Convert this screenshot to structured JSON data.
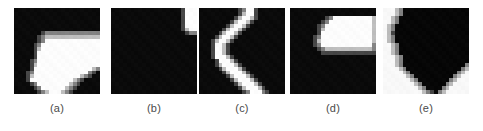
{
  "figure": {
    "type": "image-panel-row",
    "background_color": "#ffffff",
    "panel_count": 5,
    "panel_size_px": 86,
    "caption_color": "#4a4a4a",
    "panels": [
      {
        "id": "a",
        "caption": "(a)",
        "polarity": "dark-background",
        "background_color": "#0a0a0a",
        "foreground_color": "#ffffff",
        "description": "bright blob occupying lower-right, flat top edge with a downward tapering wedge at bottom",
        "grid_size": 22,
        "grid": [
          "0000000000000000000000",
          "0000000000000000000000",
          "0000000000000000000000",
          "0000000000000000000000",
          "0000000000000000000000",
          "0000000000000000000000",
          "0000000122222222222222",
          "0000001233333333333333",
          "0000001244444444444444",
          "0000012444444444444444",
          "0000013444444444444444",
          "0000014444444444444444",
          "0000014444444444444444",
          "0000124444444444444444",
          "0000134444444444444444",
          "0000144444444444444432",
          "0001244444444444444210",
          "0001344444444444432100",
          "0001444444444443210000",
          "0000124444444432100000",
          "0000012444444321000000",
          "0000001234443210000000"
        ]
      },
      {
        "id": "b",
        "caption": "(b)",
        "polarity": "dark-background",
        "background_color": "#0a0a0a",
        "foreground_color": "#ffffff",
        "description": "almost entirely dark, one small bright vertical rectangle at the top-right corner",
        "grid_size": 22,
        "grid": [
          "0000000000000000001444",
          "0000000000000000001444",
          "0000000000000000001444",
          "0000000000000000001444",
          "0000000000000000001444",
          "0000000000000000001344",
          "0000000000000000000122",
          "0000000000000000000000",
          "0000000000000000000000",
          "0000000000000000000000",
          "0000000000000000000000",
          "0000000000000000000000",
          "0000000000000000000000",
          "0000000000000000000000",
          "0000000000000000000000",
          "0000000000000000000000",
          "0000000000000000000000",
          "0000000000000000000000",
          "0000000000000000000000",
          "0000000000000000000000",
          "0000000000000000000000",
          "0000000000000000000000"
        ]
      },
      {
        "id": "c",
        "caption": "(c)",
        "polarity": "dark-background",
        "background_color": "#0a0a0a",
        "foreground_color": "#ffffff",
        "description": "bright curved stripe running top to bottom, bowing left in the middle like a crescent",
        "grid_size": 22,
        "grid": [
          "0000000000124410000000",
          "0000000000134410000000",
          "0000000001344310000000",
          "0000000013443100000000",
          "0000000134431000000000",
          "0000001344310000000000",
          "0000013443100000000000",
          "0000134431000000000000",
          "0001344310000000000000",
          "0001443100000000000000",
          "0001443100000000000000",
          "0001443100000000000000",
          "0001444310000000000000",
          "0000144431000000000000",
          "0000134443100000000000",
          "0000013444310000000000",
          "0000001344431000000000",
          "0000000134443100000000",
          "0000000013444310000000",
          "0000000001344431000000",
          "0000000000134443100000",
          "0000000000012444210000"
        ]
      },
      {
        "id": "d",
        "caption": "(d)",
        "polarity": "dark-background",
        "background_color": "#0a0a0a",
        "foreground_color": "#ffffff",
        "description": "solid bright rectangle in the upper-right quadrant, touching the top edge, dark elsewhere",
        "grid_size": 22,
        "grid": [
          "0000000000000000000000",
          "0000000000000000000000",
          "0000000001244444444443",
          "0000000012444444444443",
          "0000000124444444444443",
          "0000000134444444444443",
          "0000000144444444444443",
          "0000001244444444444443",
          "0000001344444444444443",
          "0000001244444444444442",
          "0000000123333333333332",
          "0000000011111111111111",
          "0000000000000000000000",
          "0000000000000000000000",
          "0000000000000000000000",
          "0000000000000000000000",
          "0000000000000000000000",
          "0000000000000000000000",
          "0000000000000000000000",
          "0000000000000000000000",
          "0000000000000000000000",
          "0000000000000000000000"
        ]
      },
      {
        "id": "e",
        "caption": "(e)",
        "polarity": "light-background",
        "background_color": "#ffffff",
        "foreground_color": "#0a0a0a",
        "description": "inverted patch: white background with a large dark blob filling the right side and tapering to a point at the bottom",
        "grid_size": 22,
        "grid": [
          "0001244444444444444444",
          "0001244444444444444444",
          "0012444444444444444444",
          "0012444444444444444444",
          "0124444444444444444444",
          "0124444444444444444444",
          "0134444444444444444444",
          "0124444444444444444444",
          "0124444444444444444444",
          "0012444444444444444444",
          "0012444444444444444444",
          "0012444444444444444444",
          "0001244444444444444444",
          "0001244444444444444444",
          "0001244444444444444442",
          "0000124444444444444421",
          "0000012444444444444210",
          "0000001244444444442100",
          "0000000124444444421000",
          "0000000012444444210000",
          "0000000001244442100000",
          "0000000000123421000000"
        ]
      }
    ]
  }
}
